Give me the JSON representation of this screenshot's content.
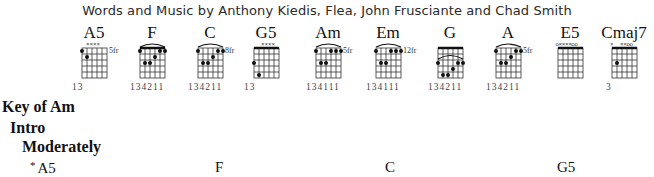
{
  "header": {
    "credits": "Words and Music by Anthony Kiedis, Flea, John Frusciante and Chad Smith"
  },
  "chords": [
    {
      "name": "A5",
      "fret_label": "5fr",
      "fingering": "13",
      "markers": "oxxxx",
      "nut": false
    },
    {
      "name": "F",
      "fret_label": "",
      "fingering": "134211",
      "markers": "",
      "nut": true
    },
    {
      "name": "C",
      "fret_label": "8fr",
      "fingering": "134211",
      "markers": "",
      "nut": false
    },
    {
      "name": "G5",
      "fret_label": "",
      "fingering": "13",
      "markers": "xxxx",
      "nut": true
    },
    {
      "name": "Am",
      "fret_label": "5fr",
      "fingering": "134111",
      "markers": "",
      "nut": false
    },
    {
      "name": "Em",
      "fret_label": "12fr",
      "fingering": "134111",
      "markers": "",
      "nut": false
    },
    {
      "name": "G",
      "fret_label": "",
      "fingering": "134211",
      "markers": "",
      "nut": true
    },
    {
      "name": "A",
      "fret_label": "5fr",
      "fingering": "134211",
      "markers": "",
      "nut": false
    },
    {
      "name": "E5",
      "fret_label": "",
      "fingering": "",
      "markers": "oxxxoo",
      "nut": true
    },
    {
      "name": "Cmaj7",
      "fret_label": "",
      "fingering": "3",
      "markers": "x xxoo",
      "nut": true
    }
  ],
  "body": {
    "key": "Key of Am",
    "section": "Intro",
    "tempo": "Moderately",
    "chord_symbols": [
      {
        "asterisk": "*",
        "label": "A5"
      },
      {
        "label": "F"
      },
      {
        "label": "C"
      },
      {
        "label": "G5"
      }
    ]
  }
}
